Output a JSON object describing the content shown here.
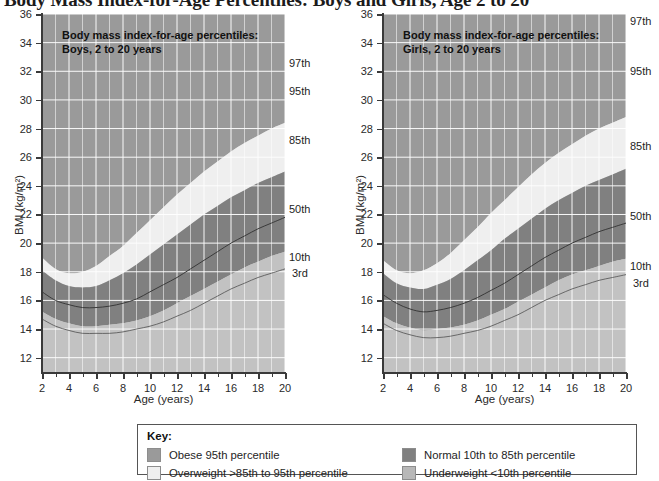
{
  "title": "Body Mass Index-for-Age Percentiles: Boys and Girls, Age 2 to 20",
  "panels": [
    {
      "id": "boys",
      "caption_line1": "Body mass index-for-age percentiles:",
      "caption_line2": "Boys, 2 to 20 years",
      "xlabel": "Age (years)",
      "ylabel": "BMI (kg/m²)",
      "percentile_labels": [
        "97th",
        "95th",
        "85th",
        "50th",
        "10th",
        "3rd"
      ]
    },
    {
      "id": "girls",
      "caption_line1": "Body mass index-for-age percentiles:",
      "caption_line2": "Girls, 2 to 20 years",
      "xlabel": "Age (years)",
      "ylabel": "BMI (kg/m²)",
      "percentile_labels": [
        "97th",
        "95th",
        "85th",
        "50th",
        "10th",
        "3rd"
      ]
    }
  ],
  "key": {
    "title": "Key:",
    "items": [
      {
        "label": "Obese 95th percentile",
        "color": "#9a9a9a"
      },
      {
        "label": "Overweight >85th  to 95th percentile",
        "color": "#efefef"
      },
      {
        "label": "Normal 10th to 85th percentile",
        "color": "#808080"
      },
      {
        "label": "Underweight <10th percentile",
        "color": "#b8b8b8"
      }
    ]
  },
  "colors": {
    "plot_background": "#cfcfcf",
    "grid": "#ffffff",
    "obese": "#9a9a9a",
    "overweight": "#efefef",
    "normal": "#808080",
    "underweight": "#c2c2c2",
    "median_line": "#3a3a3a",
    "axis": "#3a3a3a"
  },
  "chart_data": {
    "type": "area",
    "title": "Body Mass Index-for-Age Percentiles: Boys and Girls, Age 2 to 20",
    "xlabel": "Age (years)",
    "ylabel": "BMI (kg/m²)",
    "xlim": [
      2,
      20
    ],
    "ylim": [
      11,
      36
    ],
    "xticks": [
      2,
      4,
      6,
      8,
      10,
      12,
      14,
      16,
      18,
      20
    ],
    "yticks": [
      12,
      14,
      16,
      18,
      20,
      22,
      24,
      26,
      28,
      30,
      32,
      34,
      36
    ],
    "grid": true,
    "legend_position": "bottom",
    "charts": [
      {
        "name": "Boys, 2 to 20 years",
        "x": [
          2,
          3,
          4,
          5,
          6,
          7,
          8,
          9,
          10,
          11,
          12,
          13,
          14,
          15,
          16,
          17,
          18,
          19,
          20
        ],
        "series": [
          {
            "name": "3rd",
            "values": [
              14.7,
              14.2,
              13.9,
              13.7,
              13.7,
              13.7,
              13.8,
              14.0,
              14.2,
              14.5,
              14.9,
              15.3,
              15.8,
              16.3,
              16.8,
              17.2,
              17.6,
              17.9,
              18.2
            ]
          },
          {
            "name": "10th",
            "values": [
              15.2,
              14.7,
              14.4,
              14.2,
              14.2,
              14.3,
              14.4,
              14.6,
              14.9,
              15.3,
              15.8,
              16.3,
              16.8,
              17.3,
              17.8,
              18.3,
              18.7,
              19.1,
              19.4
            ]
          },
          {
            "name": "50th",
            "values": [
              16.6,
              16.0,
              15.7,
              15.5,
              15.5,
              15.6,
              15.8,
              16.1,
              16.6,
              17.1,
              17.6,
              18.2,
              18.8,
              19.4,
              20.0,
              20.5,
              21.0,
              21.4,
              21.8
            ]
          },
          {
            "name": "85th",
            "values": [
              18.1,
              17.4,
              17.0,
              16.9,
              17.0,
              17.4,
              17.9,
              18.5,
              19.2,
              19.9,
              20.6,
              21.3,
              22.0,
              22.6,
              23.2,
              23.7,
              24.2,
              24.6,
              25.0
            ]
          },
          {
            "name": "95th",
            "values": [
              19.0,
              18.2,
              17.9,
              18.0,
              18.4,
              19.1,
              19.8,
              20.7,
              21.6,
              22.5,
              23.4,
              24.2,
              25.0,
              25.7,
              26.4,
              27.0,
              27.5,
              28.0,
              28.4
            ]
          },
          {
            "name": "97th",
            "values": [
              19.4,
              18.6,
              18.4,
              18.6,
              19.2,
              20.0,
              21.0,
              22.0,
              23.1,
              24.1,
              25.1,
              26.0,
              26.9,
              27.7,
              28.4,
              29.0,
              29.6,
              30.1,
              30.5
            ]
          }
        ],
        "bands": [
          {
            "name": "Underweight <10th percentile",
            "lower": "axis_min",
            "upper": "10th",
            "color": "#c2c2c2"
          },
          {
            "name": "Normal 10th to 85th percentile",
            "lower": "10th",
            "upper": "85th",
            "color": "#808080"
          },
          {
            "name": "Overweight >85th to 95th percentile",
            "lower": "85th",
            "upper": "95th",
            "color": "#efefef"
          },
          {
            "name": "Obese 95th percentile",
            "lower": "95th",
            "upper": "axis_max",
            "color": "#9a9a9a"
          }
        ]
      },
      {
        "name": "Girls, 2 to 20 years",
        "x": [
          2,
          3,
          4,
          5,
          6,
          7,
          8,
          9,
          10,
          11,
          12,
          13,
          14,
          15,
          16,
          17,
          18,
          19,
          20
        ],
        "series": [
          {
            "name": "3rd",
            "values": [
              14.4,
              13.9,
              13.6,
              13.4,
              13.4,
              13.5,
              13.7,
              13.9,
              14.2,
              14.6,
              15.0,
              15.5,
              16.0,
              16.4,
              16.8,
              17.1,
              17.4,
              17.6,
              17.8
            ]
          },
          {
            "name": "10th",
            "values": [
              14.9,
              14.4,
              14.1,
              13.9,
              14.0,
              14.1,
              14.3,
              14.6,
              15.0,
              15.4,
              15.9,
              16.4,
              16.9,
              17.4,
              17.8,
              18.1,
              18.4,
              18.7,
              18.9
            ]
          },
          {
            "name": "50th",
            "values": [
              16.4,
              15.8,
              15.4,
              15.2,
              15.3,
              15.5,
              15.8,
              16.2,
              16.7,
              17.2,
              17.8,
              18.4,
              19.0,
              19.5,
              20.0,
              20.4,
              20.8,
              21.1,
              21.4
            ]
          },
          {
            "name": "85th",
            "values": [
              17.9,
              17.2,
              16.9,
              16.8,
              17.1,
              17.5,
              18.1,
              18.8,
              19.5,
              20.3,
              21.0,
              21.7,
              22.4,
              23.0,
              23.5,
              24.0,
              24.4,
              24.8,
              25.2
            ]
          },
          {
            "name": "95th",
            "values": [
              18.8,
              18.1,
              17.9,
              18.1,
              18.6,
              19.3,
              20.2,
              21.1,
              22.1,
              23.0,
              23.9,
              24.8,
              25.6,
              26.3,
              26.9,
              27.5,
              28.0,
              28.4,
              28.8
            ]
          },
          {
            "name": "97th",
            "values": [
              19.3,
              18.6,
              18.4,
              18.8,
              19.5,
              20.5,
              21.5,
              22.6,
              23.7,
              24.8,
              25.8,
              26.7,
              27.6,
              28.4,
              29.1,
              29.7,
              30.3,
              30.8,
              31.2
            ]
          }
        ],
        "bands": [
          {
            "name": "Underweight <10th percentile",
            "lower": "axis_min",
            "upper": "10th",
            "color": "#c2c2c2"
          },
          {
            "name": "Normal 10th to 85th percentile",
            "lower": "10th",
            "upper": "85th",
            "color": "#808080"
          },
          {
            "name": "Overweight >85th to 95th percentile",
            "lower": "85th",
            "upper": "95th",
            "color": "#efefef"
          },
          {
            "name": "Obese 95th percentile",
            "lower": "95th",
            "upper": "axis_max",
            "color": "#9a9a9a"
          }
        ]
      }
    ]
  }
}
